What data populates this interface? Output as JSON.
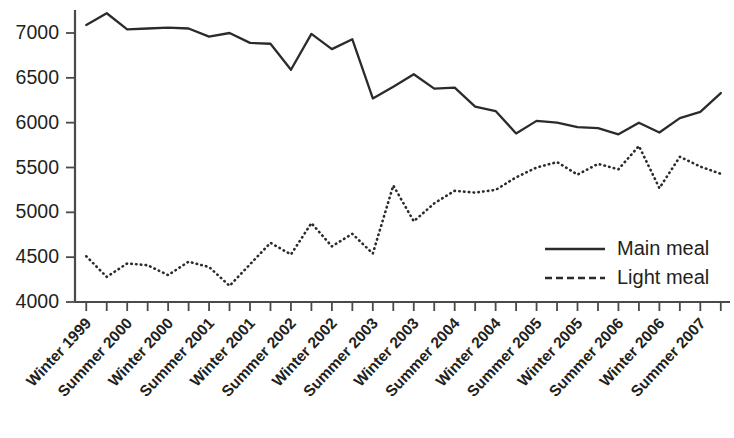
{
  "chart_data": {
    "type": "line",
    "title": "",
    "xlabel": "",
    "ylabel": "",
    "ylim": [
      4000,
      7250
    ],
    "yticks": [
      4000,
      4500,
      5000,
      5500,
      6000,
      6500,
      7000
    ],
    "grid": false,
    "legend_position": "bottom-right",
    "categories": [
      "Winter 1999",
      "Spring 2000",
      "Summer 2000",
      "Autumn 2000",
      "Winter 2000",
      "Spring 2001",
      "Summer 2001",
      "Autumn 2001",
      "Winter 2001",
      "Spring 2002",
      "Summer 2002",
      "Autumn 2002",
      "Winter 2002",
      "Spring 2003",
      "Summer 2003",
      "Autumn 2003",
      "Winter 2003",
      "Spring 2004",
      "Summer 2004",
      "Autumn 2004",
      "Winter 2004",
      "Spring 2005",
      "Summer 2005",
      "Autumn 2005",
      "Winter 2005",
      "Spring 2006",
      "Summer 2006",
      "Autumn 2006",
      "Winter 2006",
      "Spring 2007",
      "Summer 2007",
      "Autumn 2007"
    ],
    "xtick_labels": [
      "Winter 1999",
      "Summer 2000",
      "Winter 2000",
      "Summer 2001",
      "Winter 2001",
      "Summer 2002",
      "Winter 2002",
      "Summer 2003",
      "Winter 2003",
      "Summer 2004",
      "Winter 2004",
      "Summer 2005",
      "Winter 2005",
      "Summer 2006",
      "Winter 2006",
      "Summer 2007"
    ],
    "xtick_every": 2,
    "series": [
      {
        "name": "Main meal",
        "style": "solid",
        "color": "#2b2b2b",
        "values": [
          7090,
          7220,
          7040,
          7050,
          7060,
          7050,
          6960,
          7000,
          6890,
          6880,
          6590,
          6990,
          6820,
          6930,
          6270,
          6400,
          6540,
          6380,
          6390,
          6180,
          6130,
          5880,
          6020,
          6000,
          5950,
          5940,
          5870,
          6000,
          5890,
          6050,
          6120,
          6330
        ]
      },
      {
        "name": "Light meal",
        "style": "dashed",
        "color": "#2b2b2b",
        "values": [
          4510,
          4280,
          4430,
          4410,
          4300,
          4450,
          4390,
          4180,
          4420,
          4660,
          4530,
          4880,
          4620,
          4760,
          4540,
          5300,
          4900,
          5100,
          5240,
          5220,
          5250,
          5390,
          5500,
          5560,
          5420,
          5540,
          5480,
          5740,
          5270,
          5620,
          5510,
          5430
        ]
      }
    ]
  },
  "legend": {
    "items": [
      {
        "label": "Main meal",
        "style": "solid"
      },
      {
        "label": "Light meal",
        "style": "dashed"
      }
    ]
  }
}
